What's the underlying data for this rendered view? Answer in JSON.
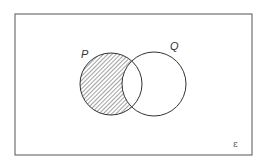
{
  "diagram": {
    "type": "venn",
    "universal_set_symbol": "ε",
    "sets": [
      {
        "name": "P",
        "shaded_region": "P only (P minus Q)"
      },
      {
        "name": "Q"
      }
    ],
    "labels": {
      "p": "P",
      "q": "Q",
      "universal": "ε"
    },
    "shading": "P ∩ Q′",
    "colors": {
      "stroke": "#333333",
      "hatch": "#444444",
      "background": "#ffffff"
    }
  }
}
